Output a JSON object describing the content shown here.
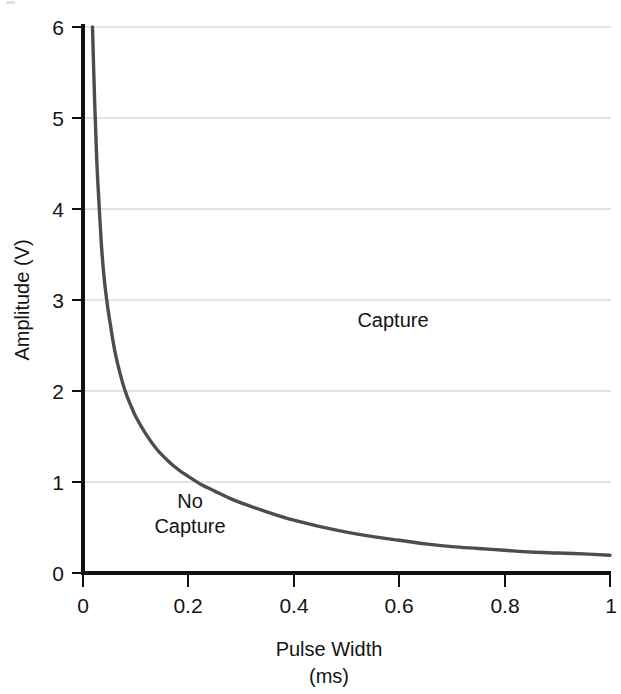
{
  "chart_data": {
    "type": "line",
    "title": "",
    "subtitle": "",
    "xlabel": "Pulse Width",
    "xunit": "(ms)",
    "ylabel": "Amplitude (V)",
    "xlim": [
      0,
      1
    ],
    "ylim": [
      0,
      6
    ],
    "grid": true,
    "legend": "none",
    "x_ticks": [
      "0",
      "0.2",
      "0.4",
      "0.6",
      "0.8",
      "1"
    ],
    "x_tick_values": [
      0,
      0.2,
      0.4,
      0.6,
      0.8,
      1
    ],
    "y_ticks": [
      "0",
      "1",
      "2",
      "3",
      "4",
      "5",
      "6"
    ],
    "y_tick_values": [
      0,
      1,
      2,
      3,
      4,
      5,
      6
    ],
    "series": [
      {
        "name": "strength-duration curve",
        "color": "#4d4d4d",
        "x": [
          0.018,
          0.022,
          0.026,
          0.03,
          0.035,
          0.04,
          0.045,
          0.05,
          0.06,
          0.07,
          0.08,
          0.09,
          0.1,
          0.12,
          0.14,
          0.16,
          0.18,
          0.2,
          0.225,
          0.25,
          0.275,
          0.3,
          0.35,
          0.4,
          0.45,
          0.5,
          0.55,
          0.6,
          0.65,
          0.7,
          0.75,
          0.8,
          0.85,
          0.9,
          0.95,
          1.0
        ],
        "y": [
          6.0,
          5.2,
          4.55,
          4.1,
          3.6,
          3.25,
          3.0,
          2.8,
          2.45,
          2.2,
          2.0,
          1.85,
          1.72,
          1.52,
          1.36,
          1.24,
          1.14,
          1.06,
          0.97,
          0.9,
          0.83,
          0.77,
          0.67,
          0.58,
          0.51,
          0.45,
          0.4,
          0.36,
          0.32,
          0.29,
          0.27,
          0.25,
          0.23,
          0.22,
          0.21,
          0.195
        ]
      }
    ],
    "annotations": [
      {
        "text": "Capture",
        "x": 0.62,
        "y": 2.7
      },
      {
        "text_line1": "No",
        "text_line2": "Capture",
        "x": 0.2,
        "y": 0.78
      }
    ]
  },
  "axes": {
    "y_title": "Amplitude (V)",
    "x_title": "Pulse Width",
    "x_units": "(ms)"
  },
  "annotations": {
    "capture": "Capture",
    "no_capture_line1": "No",
    "no_capture_line2": "Capture"
  }
}
